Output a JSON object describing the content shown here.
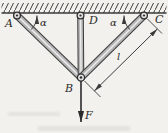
{
  "figure": {
    "points": {
      "a": "A",
      "b": "B",
      "c": "C",
      "d": "D"
    },
    "angle_left": "α",
    "angle_right": "α",
    "length_label": "l",
    "force_label": "F",
    "colors": {
      "background": "#f2f1ed",
      "line": "#3a3a3a",
      "bar_fill": "#b6b6b6",
      "bar_highlight": "#ebebeb",
      "pin_fill": "#dcdcdc",
      "text": "#2b2b2b"
    }
  }
}
